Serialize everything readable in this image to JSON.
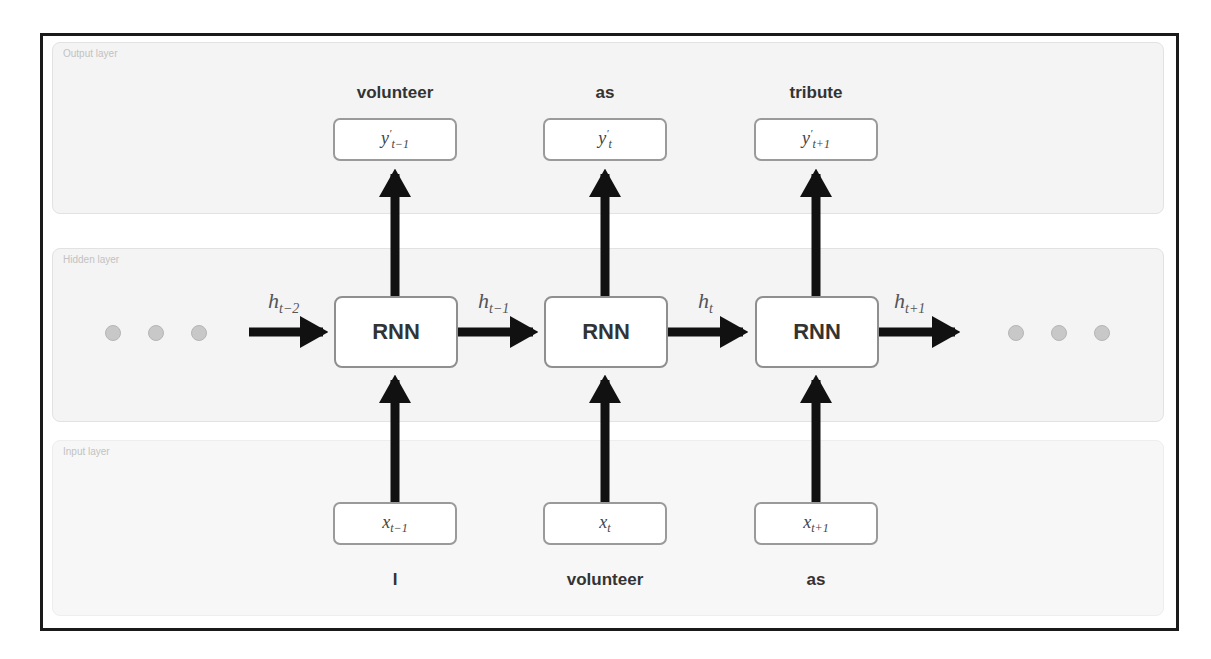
{
  "diagram": {
    "type": "unrolled-rnn",
    "layers": {
      "output": {
        "label": "Output layer"
      },
      "hidden": {
        "label": "Hidden layer"
      },
      "input": {
        "label": "Input layer"
      }
    },
    "timesteps": [
      {
        "output_word": "volunteer",
        "output_symbol": {
          "base": "y",
          "prime": "′",
          "sub": "t−1"
        },
        "cell_label": "RNN",
        "input_symbol": {
          "base": "x",
          "sub": "t−1"
        },
        "input_word": "I"
      },
      {
        "output_word": "as",
        "output_symbol": {
          "base": "y",
          "prime": "′",
          "sub": "t"
        },
        "cell_label": "RNN",
        "input_symbol": {
          "base": "x",
          "sub": "t"
        },
        "input_word": "volunteer"
      },
      {
        "output_word": "tribute",
        "output_symbol": {
          "base": "y",
          "prime": "′",
          "sub": "t+1"
        },
        "cell_label": "RNN",
        "input_symbol": {
          "base": "x",
          "sub": "t+1"
        },
        "input_word": "as"
      }
    ],
    "hidden_states": [
      {
        "base": "h",
        "sub": "t−2"
      },
      {
        "base": "h",
        "sub": "t−1"
      },
      {
        "base": "h",
        "sub": "t"
      },
      {
        "base": "h",
        "sub": "t+1"
      }
    ],
    "ellipsis_left": "• • •",
    "ellipsis_right": "• • •",
    "colors": {
      "arrow": "#111111",
      "box_border": "#9a9a9a",
      "layer_bg": "#f4f4f4",
      "dot": "#c8c8c8"
    }
  }
}
